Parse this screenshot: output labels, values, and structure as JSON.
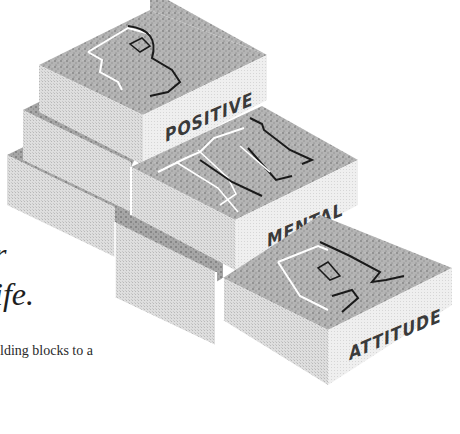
{
  "page": {
    "text_fragments": {
      "heading_line1_tail": "r",
      "heading_line2_tail": "ife.",
      "body_line_fragment": "lding blocks to a"
    }
  },
  "illustration": {
    "description": "Isometric stacked building blocks spelling PMA",
    "blocks": [
      {
        "letter": "P",
        "label": "POSITIVE"
      },
      {
        "letter": "M",
        "label": "MENTAL"
      },
      {
        "letter": "A",
        "label": "ATTITUDE"
      }
    ],
    "colors": {
      "top_face": "#a9a9a9",
      "left_face": "#d9d9d9",
      "right_face": "#ececec",
      "label_text": "#3a3a3a",
      "letter_outline_light": "#ffffff",
      "letter_outline_dark": "#1a1a1a"
    }
  }
}
